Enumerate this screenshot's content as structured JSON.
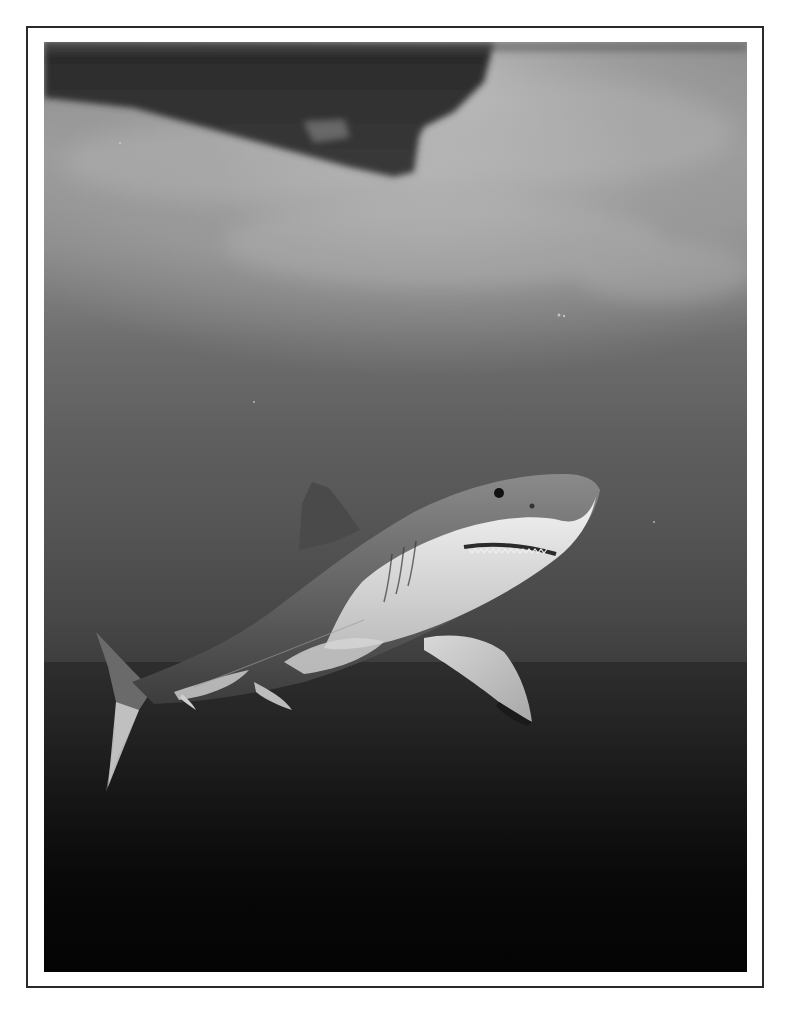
{
  "image": {
    "subject": "great white shark swimming underwater beneath a boat hull",
    "style": "black-and-white photograph",
    "elements": [
      {
        "name": "boat-hull-silhouette",
        "position": "top-left"
      },
      {
        "name": "water-surface",
        "position": "top"
      },
      {
        "name": "great-white-shark",
        "position": "center"
      },
      {
        "name": "deep-water",
        "position": "bottom"
      }
    ]
  },
  "colors": {
    "page_background": "#ffffff",
    "frame_border": "#2a2a2a",
    "surface_light": "#b0b0b0",
    "mid_water": "#555555",
    "deep_water": "#050505",
    "shark_back": "#6a6a6a",
    "shark_belly": "#e6e6e6"
  }
}
